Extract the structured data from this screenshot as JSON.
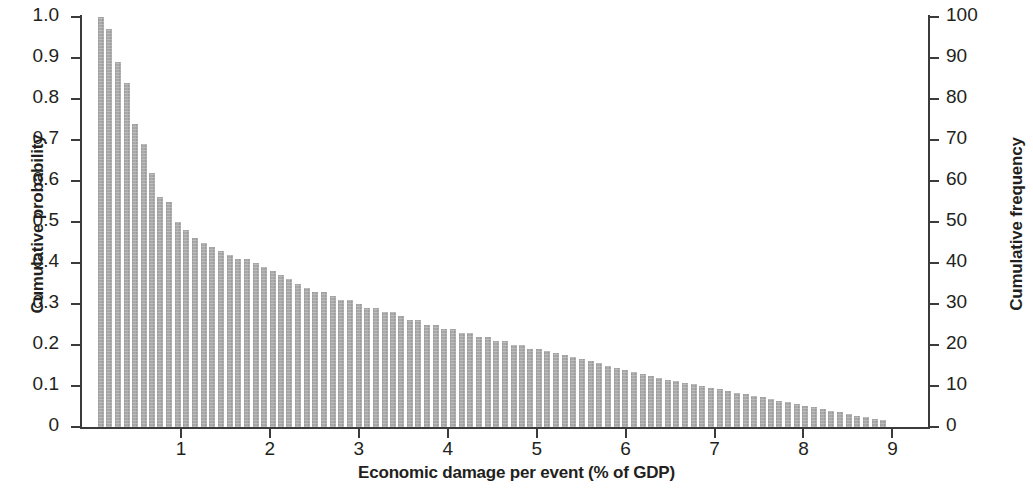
{
  "chart_data": {
    "type": "bar",
    "title": "",
    "subtitle": "",
    "xlabel": "Economic damage per event (% of GDP)",
    "ylabel": "Cumulative probability",
    "ylabel_right": "Cumulative frequency",
    "xlim": [
      0,
      9.4
    ],
    "ylim": [
      0,
      1.0
    ],
    "ylim_right": [
      0,
      100
    ],
    "grid": false,
    "legend": null,
    "bar_color": "#a9a9a9",
    "axis_color": "#3b3b3b",
    "text_color": "#231f20",
    "xticks": [
      1,
      2,
      3,
      4,
      5,
      6,
      7,
      8,
      9
    ],
    "xticklabels": [
      "1",
      "2",
      "3",
      "4",
      "5",
      "6",
      "7",
      "8",
      "9"
    ],
    "yticks": [
      0,
      0.1,
      0.2,
      0.3,
      0.4,
      0.5,
      0.6,
      0.7,
      0.8,
      0.9,
      1.0
    ],
    "yticklabels": [
      "0",
      "0.1",
      "0.2",
      "0.3",
      "0.4",
      "0.5",
      "0.6",
      "0.7",
      "0.8",
      "0.9",
      "1.0"
    ],
    "yticks_right": [
      0,
      10,
      20,
      30,
      40,
      50,
      60,
      70,
      80,
      90,
      100
    ],
    "yticklabels_right": [
      "0",
      "10",
      "20",
      "30",
      "40",
      "50",
      "60",
      "70",
      "80",
      "90",
      "100"
    ],
    "x": [
      0.1,
      0.19,
      0.29,
      0.39,
      0.48,
      0.58,
      0.68,
      0.77,
      0.87,
      0.97,
      1.06,
      1.16,
      1.26,
      1.35,
      1.45,
      1.55,
      1.64,
      1.74,
      1.84,
      1.93,
      2.03,
      2.13,
      2.22,
      2.32,
      2.42,
      2.51,
      2.61,
      2.71,
      2.8,
      2.9,
      3.0,
      3.09,
      3.19,
      3.29,
      3.38,
      3.48,
      3.58,
      3.67,
      3.77,
      3.87,
      3.96,
      4.06,
      4.16,
      4.25,
      4.35,
      4.45,
      4.54,
      4.64,
      4.74,
      4.83,
      4.93,
      5.03,
      5.12,
      5.22,
      5.32,
      5.41,
      5.51,
      5.61,
      5.7,
      5.8,
      5.9,
      5.99,
      6.09,
      6.19,
      6.28,
      6.38,
      6.48,
      6.57,
      6.67,
      6.77,
      6.86,
      6.96,
      7.06,
      7.15,
      7.25,
      7.35,
      7.44,
      7.54,
      7.64,
      7.73,
      7.83,
      7.93,
      8.02,
      8.12,
      8.22,
      8.31,
      8.41,
      8.51,
      8.6,
      8.7,
      8.8,
      8.89
    ],
    "values": [
      1.0,
      0.97,
      0.89,
      0.84,
      0.74,
      0.69,
      0.62,
      0.56,
      0.55,
      0.5,
      0.48,
      0.46,
      0.45,
      0.44,
      0.43,
      0.42,
      0.41,
      0.41,
      0.4,
      0.39,
      0.38,
      0.37,
      0.36,
      0.35,
      0.34,
      0.33,
      0.33,
      0.32,
      0.31,
      0.31,
      0.3,
      0.29,
      0.29,
      0.28,
      0.28,
      0.27,
      0.26,
      0.26,
      0.25,
      0.25,
      0.24,
      0.24,
      0.23,
      0.23,
      0.22,
      0.22,
      0.21,
      0.21,
      0.2,
      0.2,
      0.19,
      0.19,
      0.185,
      0.18,
      0.175,
      0.17,
      0.165,
      0.16,
      0.155,
      0.15,
      0.145,
      0.14,
      0.135,
      0.13,
      0.125,
      0.12,
      0.115,
      0.112,
      0.108,
      0.104,
      0.1,
      0.096,
      0.092,
      0.088,
      0.084,
      0.08,
      0.076,
      0.072,
      0.068,
      0.064,
      0.06,
      0.056,
      0.052,
      0.048,
      0.044,
      0.04,
      0.036,
      0.032,
      0.028,
      0.024,
      0.02,
      0.016
    ],
    "values_right": [
      100,
      97,
      89,
      84,
      74,
      69,
      62,
      56,
      55,
      50,
      48,
      46,
      45,
      44,
      43,
      42,
      41,
      41,
      40,
      39,
      38,
      37,
      36,
      35,
      34,
      33,
      33,
      32,
      31,
      31,
      30,
      29,
      29,
      28,
      28,
      27,
      26,
      26,
      25,
      25,
      24,
      24,
      23,
      23,
      22,
      22,
      21,
      21,
      20,
      20,
      19,
      19,
      18.5,
      18,
      17.5,
      17,
      16.5,
      16,
      15.5,
      15,
      14.5,
      14,
      13.5,
      13,
      12.5,
      12,
      11.5,
      11.2,
      10.8,
      10.4,
      10,
      9.6,
      9.2,
      8.8,
      8.4,
      8,
      7.6,
      7.2,
      6.8,
      6.4,
      6,
      5.6,
      5.2,
      4.8,
      4.4,
      4,
      3.6,
      3.2,
      2.8,
      2.4,
      2,
      1.6
    ]
  }
}
